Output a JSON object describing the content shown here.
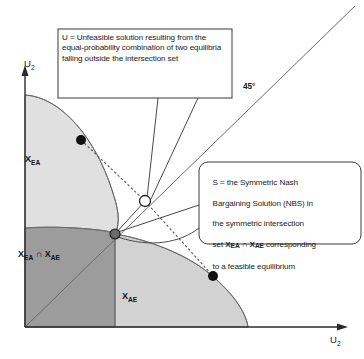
{
  "figure": {
    "background_color": "#ffffff"
  },
  "axes": {
    "y_label": "U",
    "y_label_sub": "2",
    "x_label": "U",
    "x_label_sub": "2",
    "origin": {
      "x": 25,
      "y": 327
    },
    "x_axis_end": {
      "x": 348,
      "y": 327
    },
    "y_axis_top": {
      "x": 25,
      "y": 66
    },
    "color": "#333333"
  },
  "diagonal": {
    "label": "45°",
    "from": {
      "x": 25,
      "y": 327
    },
    "to": {
      "x": 355,
      "y": 5
    },
    "color": "#555555"
  },
  "regions": [
    {
      "name": "X_EA",
      "label_main": "X",
      "label_sub": "EA",
      "fill": "#e0e0e0",
      "description": "upper-left feasible set of equilibrium EA"
    },
    {
      "name": "X_EA_intersect_X_AE",
      "label_main": "X",
      "label_sub": "EA",
      "label_main2": "X",
      "label_sub2": "AE",
      "label_operator": "∩",
      "fill": "#9c9c9c",
      "description": "symmetric intersection set"
    },
    {
      "name": "X_AE",
      "label_main": "X",
      "label_sub": "AE",
      "fill": "#d2d2d2",
      "description": "lower-right feasible set of equilibrium AE"
    }
  ],
  "points": [
    {
      "id": "equilibrium-ea",
      "style": "filled",
      "fill": "#111111",
      "x": 81,
      "y": 140,
      "r": 5
    },
    {
      "id": "equilibrium-ae",
      "style": "filled",
      "fill": "#111111",
      "x": 213,
      "y": 276,
      "r": 5
    },
    {
      "id": "point-u-unfeasible",
      "style": "open",
      "fill": "#ffffff",
      "stroke": "#222222",
      "x": 145,
      "y": 201,
      "r": 5.5
    },
    {
      "id": "point-s-nbs",
      "style": "filled",
      "fill": "#6b6b6b",
      "stroke": "#222222",
      "x": 115,
      "y": 234,
      "r": 5
    }
  ],
  "callouts": [
    {
      "id": "callout-u",
      "shape": "rectangle",
      "text": "U = Unfeasible solution resulting from the equal-probability combination of two equilibria falling outside the intersection set",
      "box": {
        "x": 58,
        "y": 29,
        "w": 174,
        "h": 69
      },
      "border_color": "#333333",
      "fill": "#ffffff"
    },
    {
      "id": "callout-s",
      "shape": "rounded-rectangle",
      "text": "S = the Symmetric Nash Bargaining Solution (NBS) in the symmetric intersection set X_EA ∩ X_AE corresponding to a feasible equilibrium",
      "text_line1": "S = the Symmetric Nash",
      "text_line2": "Bargaining Solution (NBS) in",
      "text_line3": "the symmetric intersection",
      "text_line4_pre": "set ",
      "text_line4_x1": "X",
      "text_line4_sub1": "EA",
      "text_line4_op": " ∩ ",
      "text_line4_x2": "X",
      "text_line4_sub2": "AE",
      "text_line4_post": " corresponding",
      "text_line5": "to a feasible equilibrium",
      "box": {
        "x": 199,
        "y": 162,
        "w": 162,
        "h": 82
      },
      "border_color": "#333333",
      "fill": "#ffffff"
    }
  ],
  "connectors": [
    {
      "id": "dashed-ea-to-u",
      "style": "dashed",
      "from": "equilibrium-ea",
      "to": "point-u-unfeasible"
    },
    {
      "id": "dashed-u-to-ae",
      "style": "dashed",
      "from": "point-u-unfeasible",
      "to": "equilibrium-ae"
    },
    {
      "id": "solid-s-to-u",
      "style": "solid",
      "from": "point-s-nbs",
      "to": "point-u-unfeasible"
    },
    {
      "id": "leader-u-box-left",
      "style": "solid",
      "from": "callout-u",
      "to": "point-u-unfeasible"
    },
    {
      "id": "leader-u-box-right",
      "style": "solid",
      "from": "callout-u",
      "to": "point-u-unfeasible"
    },
    {
      "id": "leader-s-box-upper",
      "style": "solid",
      "from": "callout-s",
      "to": "point-s-nbs"
    },
    {
      "id": "leader-s-box-lower",
      "style": "solid",
      "from": "callout-s",
      "to": "point-s-nbs"
    }
  ],
  "colors": {
    "region_light": "#e0e0e0",
    "region_mid": "#d2d2d2",
    "region_dark": "#9c9c9c",
    "stroke": "#555555",
    "text": "#1a1a1a"
  }
}
